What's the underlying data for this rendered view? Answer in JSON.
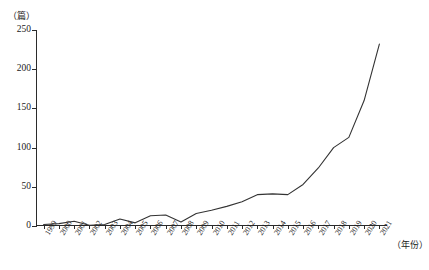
{
  "axes": {
    "y_unit_label": "（篇）",
    "x_unit_label": "（年份）",
    "y_ticks": [
      "0",
      "50",
      "100",
      "150",
      "200",
      "250"
    ]
  },
  "caption": {
    "text": ""
  },
  "chart_data": {
    "type": "line",
    "title": "",
    "xlabel": "（年份）",
    "ylabel": "（篇）",
    "ylim": [
      0,
      250
    ],
    "grid": false,
    "legend": "none",
    "line_color": "#333333",
    "categories": [
      "1999",
      "2000",
      "2001",
      "2002",
      "2003",
      "2004",
      "2005",
      "2006",
      "2007",
      "2008",
      "2009",
      "2010",
      "2011",
      "2012",
      "2013",
      "2014",
      "2015",
      "2016",
      "2017",
      "2018",
      "2019",
      "2020",
      "2021"
    ],
    "values": [
      2,
      3,
      6,
      1,
      2,
      9,
      4,
      13,
      14,
      5,
      16,
      20,
      25,
      31,
      40,
      41,
      40,
      53,
      74,
      100,
      113,
      160,
      232
    ],
    "tick_labels": [
      "1999",
      "2000",
      "2001",
      "2002",
      "2003",
      "2004",
      "2005",
      "2006",
      "2007",
      "2008",
      "2009",
      "2010",
      "2011",
      "2012",
      "2013",
      "2014",
      "2015",
      "2016",
      "2017",
      "2018",
      "2019",
      "2020",
      "2021"
    ]
  }
}
